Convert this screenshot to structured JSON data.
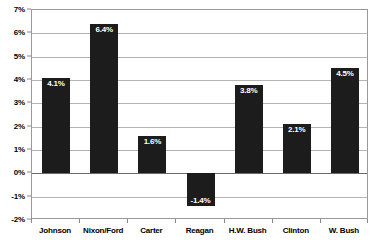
{
  "chart_data": {
    "type": "bar",
    "title": "",
    "subtitle": "",
    "xlabel": "",
    "ylabel": "",
    "categories": [
      "Johnson",
      "Nixon/Ford",
      "Carter",
      "Reagan",
      "H.W. Bush",
      "Clinton",
      "W. Bush"
    ],
    "values": [
      4.1,
      6.4,
      1.6,
      -1.4,
      3.8,
      2.1,
      4.5
    ],
    "data_labels": [
      "4.1%",
      "6.4%",
      "1.6%",
      "-1.4%",
      "3.8%",
      "2.1%",
      "4.5%"
    ],
    "ylim": [
      -2,
      7
    ],
    "ytick_values": [
      7,
      6,
      5,
      4,
      3,
      2,
      1,
      0,
      -1,
      -2
    ],
    "ytick_labels": [
      "7%",
      "6%",
      "5%",
      "4%",
      "3%",
      "2%",
      "1%",
      "0%",
      "-1%",
      "-2%"
    ],
    "grid": true,
    "grid_axis": "y",
    "legend": false,
    "legend_position": "none",
    "bar_color": "#1c1c1c",
    "data_label_color": "#ffffff",
    "gridline_color": "#b4b4b4",
    "axis_color": "#9a9a9a",
    "background_color": "#ffffff"
  }
}
